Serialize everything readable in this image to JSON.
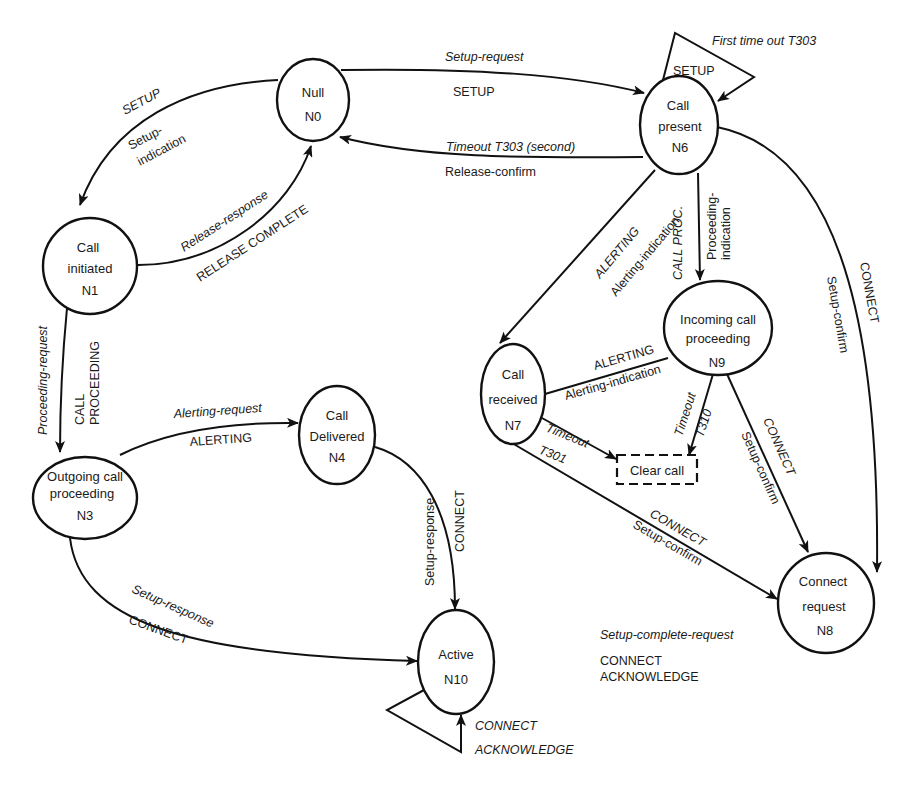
{
  "diagram": {
    "type": "state-machine",
    "colors": {
      "stroke": "#111111",
      "text": "#1a1a1a",
      "background": "#ffffff"
    },
    "nodes": {
      "n0": {
        "id": "N0",
        "lines": [
          "Null",
          "N0"
        ]
      },
      "n1": {
        "id": "N1",
        "lines": [
          "Call",
          "initiated",
          "N1"
        ]
      },
      "n3": {
        "id": "N3",
        "lines": [
          "Outgoing call",
          "proceeding",
          "N3"
        ]
      },
      "n4": {
        "id": "N4",
        "lines": [
          "Call",
          "Delivered",
          "N4"
        ]
      },
      "n6": {
        "id": "N6",
        "lines": [
          "Call",
          "present",
          "N6"
        ]
      },
      "n7": {
        "id": "N7",
        "lines": [
          "Call",
          "received",
          "N7"
        ]
      },
      "n8": {
        "id": "N8",
        "lines": [
          "Connect",
          "request",
          "N8"
        ]
      },
      "n9": {
        "id": "N9",
        "lines": [
          "Incoming call",
          "proceeding",
          "N9"
        ]
      },
      "n10": {
        "id": "N10",
        "lines": [
          "Active",
          "N10"
        ]
      },
      "clear_call": {
        "label": "Clear call"
      }
    },
    "edges": {
      "n0_n1": {
        "from": "N0",
        "to": "N1",
        "message": "SETUP",
        "primitive": "Setup-",
        "primitive2": "indication"
      },
      "n1_n0": {
        "from": "N1",
        "to": "N0",
        "primitive": "Release-response",
        "message": "RELEASE COMPLETE"
      },
      "n0_n6": {
        "from": "N0",
        "to": "N6",
        "primitive": "Setup-request",
        "message": "SETUP"
      },
      "n6_n0": {
        "from": "N6",
        "to": "N0",
        "primitive": "Timeout T303 (second)",
        "message": "Release-confirm"
      },
      "n6_self": {
        "from": "N6",
        "to": "N6",
        "primitive": "First time out T303",
        "message": "SETUP"
      },
      "n1_n3": {
        "from": "N1",
        "to": "N3",
        "primitive": "Proceeding-request",
        "message": "CALL",
        "message2": "PROCEEDING"
      },
      "n3_n4": {
        "from": "N3",
        "to": "N4",
        "primitive": "Alerting-request",
        "message": "ALERTING"
      },
      "n4_n10": {
        "from": "N4",
        "to": "N10",
        "primitive": "Setup-response",
        "message": "CONNECT"
      },
      "n3_n10": {
        "from": "N3",
        "to": "N10",
        "primitive": "Setup-response",
        "message": "CONNECT"
      },
      "n10_self": {
        "from": "N10",
        "to": "N10",
        "message": "CONNECT",
        "message2": "ACKNOWLEDGE"
      },
      "n6_n7": {
        "from": "N6",
        "to": "N7",
        "message": "ALERTING",
        "primitive": "Alerting-indication"
      },
      "n6_n9": {
        "from": "N6",
        "to": "N9",
        "message": "CALL PROC.",
        "primitive": "Proceeding-",
        "primitive2": "indication"
      },
      "n6_n8": {
        "from": "N6",
        "to": "N8",
        "message": "CONNECT",
        "primitive": "Setup-confirm"
      },
      "n9_n7": {
        "from": "N9",
        "to": "N7",
        "message": "ALERTING",
        "primitive": "Alerting-indication"
      },
      "n7_clear": {
        "from": "N7",
        "to": "Clear call",
        "primitive": "Timeout",
        "primitive2": "T301"
      },
      "n9_clear": {
        "from": "N9",
        "to": "Clear call",
        "primitive": "Timeout",
        "primitive2": "T310"
      },
      "n9_n8": {
        "from": "N9",
        "to": "N8",
        "message": "CONNECT",
        "primitive": "Setup-confirm"
      },
      "n7_n8": {
        "from": "N7",
        "to": "N8",
        "message": "CONNECT",
        "primitive": "Setup-confirm"
      },
      "n8_n10_note": {
        "primitive": "Setup-complete-request",
        "message": "CONNECT",
        "message2": "ACKNOWLEDGE"
      }
    }
  }
}
